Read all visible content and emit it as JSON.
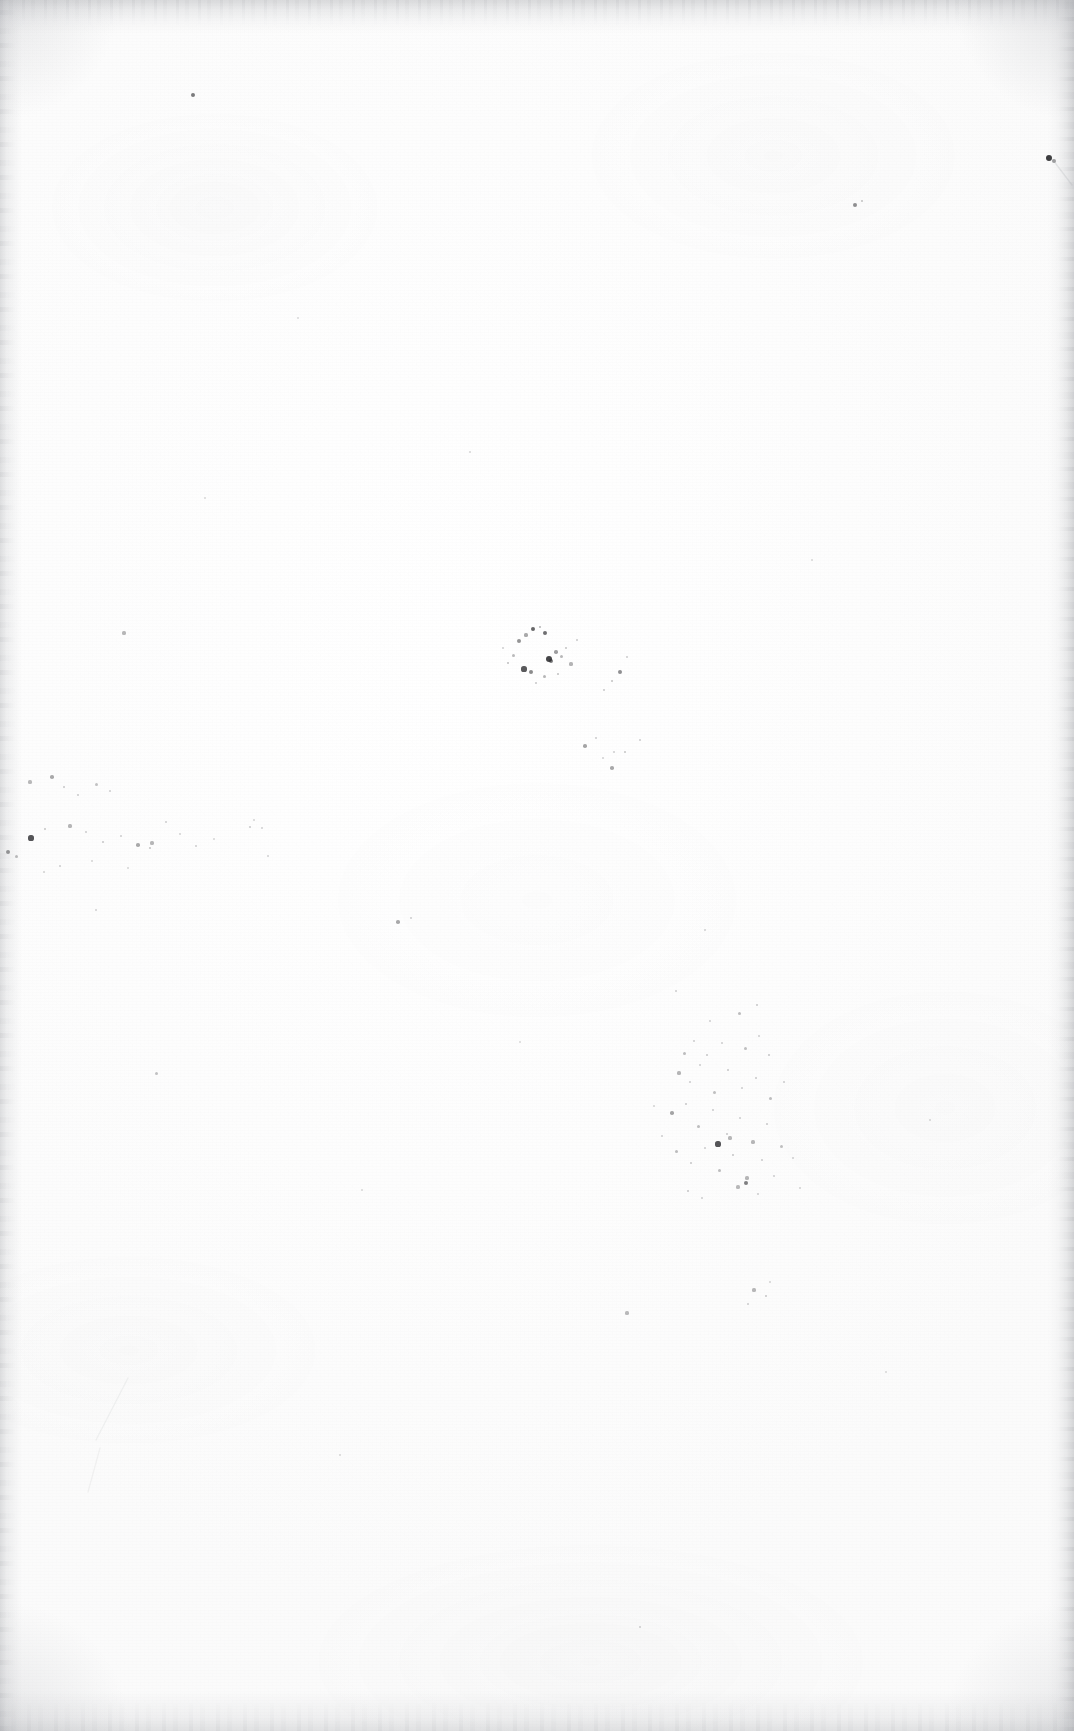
{
  "page": {
    "kind": "scanned-blank-page",
    "width_px": 1074,
    "height_px": 1731,
    "paper_color": "#fdfdfd",
    "ink_speck_color": "#2b2b2e",
    "edge_shadow_color": "#a8aaae",
    "visible_text": "",
    "page_number": "",
    "header": "",
    "footer": ""
  },
  "artifacts": {
    "edges": [
      {
        "name": "top-edge-shadow",
        "side": "top",
        "thickness_px": 34,
        "strength": "medium"
      },
      {
        "name": "bottom-edge-shadow",
        "side": "bottom",
        "thickness_px": 40,
        "strength": "light"
      },
      {
        "name": "left-edge-shadow",
        "side": "left",
        "thickness_px": 22,
        "strength": "light"
      },
      {
        "name": "right-edge-shadow",
        "side": "right",
        "thickness_px": 26,
        "strength": "medium"
      }
    ],
    "marks": [
      {
        "name": "top-right-ink-mark",
        "x": 1049,
        "y": 158,
        "w": 7,
        "h": 5,
        "opacity": 0.9
      }
    ],
    "scratches": [
      {
        "name": "bottom-left-scratch-upper",
        "x1": 128,
        "y1": 1378,
        "x2": 96,
        "y2": 1440,
        "opacity": 0.1
      },
      {
        "name": "bottom-left-scratch-lower",
        "x1": 100,
        "y1": 1448,
        "x2": 88,
        "y2": 1492,
        "opacity": 0.09
      },
      {
        "name": "top-right-mark-tail",
        "x1": 1053,
        "y1": 160,
        "x2": 1072,
        "y2": 185,
        "opacity": 0.18
      }
    ],
    "speck_clusters": [
      {
        "name": "center-cluster",
        "specks": [
          [
            519,
            641,
            2.0,
            0.5
          ],
          [
            526,
            635,
            1.6,
            0.4
          ],
          [
            533,
            629,
            2.4,
            0.72
          ],
          [
            540,
            627,
            1.4,
            0.35
          ],
          [
            545,
            633,
            2.2,
            0.68
          ],
          [
            549,
            659,
            3.0,
            0.88
          ],
          [
            551,
            661,
            2.2,
            0.62
          ],
          [
            556,
            652,
            1.8,
            0.45
          ],
          [
            561,
            656,
            1.5,
            0.33
          ],
          [
            566,
            648,
            1.3,
            0.28
          ],
          [
            524,
            669,
            2.6,
            0.78
          ],
          [
            531,
            672,
            2.0,
            0.55
          ],
          [
            513,
            655,
            1.5,
            0.32
          ],
          [
            508,
            663,
            1.4,
            0.3
          ],
          [
            571,
            664,
            1.6,
            0.35
          ],
          [
            544,
            676,
            1.5,
            0.34
          ],
          [
            536,
            683,
            1.3,
            0.26
          ],
          [
            558,
            674,
            1.4,
            0.29
          ],
          [
            577,
            640,
            1.3,
            0.25
          ],
          [
            503,
            648,
            1.2,
            0.22
          ],
          [
            620,
            672,
            2.0,
            0.52
          ],
          [
            612,
            681,
            1.4,
            0.28
          ],
          [
            627,
            657,
            1.3,
            0.24
          ],
          [
            604,
            690,
            1.3,
            0.25
          ],
          [
            585,
            746,
            1.8,
            0.42
          ],
          [
            596,
            738,
            1.3,
            0.24
          ],
          [
            612,
            768,
            1.8,
            0.4
          ],
          [
            625,
            752,
            1.4,
            0.27
          ],
          [
            640,
            740,
            1.3,
            0.23
          ],
          [
            603,
            758,
            1.2,
            0.21
          ]
        ]
      },
      {
        "name": "left-scatter",
        "specks": [
          [
            30,
            782,
            1.6,
            0.32
          ],
          [
            52,
            777,
            1.8,
            0.4
          ],
          [
            64,
            787,
            1.4,
            0.26
          ],
          [
            78,
            795,
            1.3,
            0.24
          ],
          [
            96,
            784,
            1.5,
            0.28
          ],
          [
            110,
            791,
            1.3,
            0.22
          ],
          [
            31,
            838,
            2.6,
            0.8
          ],
          [
            45,
            829,
            1.4,
            0.27
          ],
          [
            8,
            852,
            2.0,
            0.55
          ],
          [
            16,
            856,
            1.5,
            0.32
          ],
          [
            70,
            826,
            1.6,
            0.34
          ],
          [
            86,
            832,
            1.3,
            0.23
          ],
          [
            103,
            842,
            1.4,
            0.26
          ],
          [
            121,
            836,
            1.3,
            0.22
          ],
          [
            138,
            845,
            1.8,
            0.4
          ],
          [
            152,
            843,
            1.6,
            0.33
          ],
          [
            150,
            848,
            1.4,
            0.28
          ],
          [
            166,
            822,
            1.3,
            0.22
          ],
          [
            180,
            834,
            1.2,
            0.2
          ],
          [
            196,
            846,
            1.3,
            0.22
          ],
          [
            214,
            839,
            1.2,
            0.19
          ],
          [
            60,
            866,
            1.3,
            0.22
          ],
          [
            44,
            872,
            1.2,
            0.2
          ],
          [
            92,
            861,
            1.2,
            0.19
          ],
          [
            128,
            868,
            1.2,
            0.19
          ],
          [
            250,
            827,
            1.4,
            0.25
          ],
          [
            254,
            820,
            1.2,
            0.2
          ],
          [
            268,
            856,
            1.3,
            0.21
          ]
        ]
      },
      {
        "name": "lower-right-cluster",
        "specks": [
          [
            739,
            1013,
            1.5,
            0.3
          ],
          [
            676,
            991,
            1.3,
            0.23
          ],
          [
            710,
            1021,
            1.3,
            0.22
          ],
          [
            757,
            1005,
            1.4,
            0.25
          ],
          [
            684,
            1053,
            1.5,
            0.3
          ],
          [
            694,
            1041,
            1.3,
            0.23
          ],
          [
            707,
            1055,
            1.4,
            0.26
          ],
          [
            722,
            1043,
            1.3,
            0.22
          ],
          [
            745,
            1048,
            1.5,
            0.29
          ],
          [
            759,
            1036,
            1.3,
            0.22
          ],
          [
            769,
            1055,
            1.4,
            0.26
          ],
          [
            679,
            1073,
            1.6,
            0.34
          ],
          [
            690,
            1082,
            1.3,
            0.23
          ],
          [
            700,
            1065,
            1.3,
            0.22
          ],
          [
            714,
            1092,
            1.5,
            0.29
          ],
          [
            728,
            1070,
            1.4,
            0.25
          ],
          [
            742,
            1088,
            1.3,
            0.22
          ],
          [
            756,
            1078,
            1.4,
            0.25
          ],
          [
            770,
            1098,
            1.5,
            0.3
          ],
          [
            784,
            1082,
            1.3,
            0.22
          ],
          [
            672,
            1113,
            1.8,
            0.42
          ],
          [
            686,
            1104,
            1.4,
            0.26
          ],
          [
            698,
            1126,
            1.5,
            0.3
          ],
          [
            713,
            1110,
            1.3,
            0.23
          ],
          [
            727,
            1134,
            1.4,
            0.26
          ],
          [
            740,
            1118,
            1.3,
            0.22
          ],
          [
            753,
            1142,
            1.6,
            0.33
          ],
          [
            767,
            1124,
            1.4,
            0.25
          ],
          [
            781,
            1146,
            1.5,
            0.29
          ],
          [
            676,
            1151,
            1.5,
            0.3
          ],
          [
            691,
            1163,
            1.4,
            0.26
          ],
          [
            705,
            1148,
            1.3,
            0.22
          ],
          [
            719,
            1170,
            1.5,
            0.3
          ],
          [
            733,
            1155,
            1.4,
            0.26
          ],
          [
            747,
            1178,
            1.6,
            0.34
          ],
          [
            762,
            1160,
            1.3,
            0.23
          ],
          [
            718,
            1144,
            2.6,
            0.8
          ],
          [
            730,
            1138,
            1.6,
            0.33
          ],
          [
            746,
            1183,
            2.2,
            0.6
          ],
          [
            738,
            1187,
            1.6,
            0.32
          ],
          [
            688,
            1191,
            1.4,
            0.26
          ],
          [
            702,
            1198,
            1.3,
            0.22
          ],
          [
            758,
            1194,
            1.3,
            0.22
          ],
          [
            774,
            1176,
            1.3,
            0.22
          ],
          [
            793,
            1158,
            1.3,
            0.21
          ],
          [
            800,
            1188,
            1.2,
            0.2
          ],
          [
            662,
            1136,
            1.3,
            0.22
          ],
          [
            654,
            1106,
            1.2,
            0.2
          ],
          [
            754,
            1290,
            1.6,
            0.33
          ],
          [
            766,
            1296,
            1.4,
            0.26
          ],
          [
            748,
            1304,
            1.3,
            0.22
          ],
          [
            770,
            1282,
            1.2,
            0.2
          ]
        ]
      },
      {
        "name": "sparse-scatter",
        "specks": [
          [
            193,
            95,
            2.2,
            0.62
          ],
          [
            855,
            205,
            2.0,
            0.52
          ],
          [
            862,
            201,
            1.4,
            0.28
          ],
          [
            124,
            633,
            1.6,
            0.33
          ],
          [
            398,
            922,
            1.8,
            0.4
          ],
          [
            411,
            918,
            1.3,
            0.22
          ],
          [
            262,
            828,
            1.3,
            0.21
          ],
          [
            156,
            1073,
            1.5,
            0.28
          ],
          [
            627,
            1313,
            1.6,
            0.32
          ],
          [
            614,
            752,
            1.3,
            0.22
          ],
          [
            470,
            452,
            1.2,
            0.19
          ],
          [
            298,
            318,
            1.1,
            0.17
          ],
          [
            705,
            930,
            1.3,
            0.21
          ],
          [
            930,
            1120,
            1.2,
            0.19
          ],
          [
            886,
            1372,
            1.2,
            0.18
          ],
          [
            362,
            1190,
            1.2,
            0.18
          ],
          [
            205,
            498,
            1.2,
            0.18
          ],
          [
            812,
            560,
            1.2,
            0.18
          ],
          [
            96,
            910,
            1.3,
            0.21
          ],
          [
            520,
            1042,
            1.2,
            0.18
          ],
          [
            1049,
            158,
            3.4,
            0.92
          ],
          [
            1054,
            161,
            2.0,
            0.45
          ],
          [
            640,
            1627,
            1.3,
            0.22
          ],
          [
            340,
            1455,
            1.2,
            0.18
          ]
        ]
      }
    ]
  }
}
